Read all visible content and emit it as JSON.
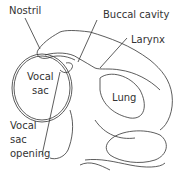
{
  "diagram": {
    "labels": {
      "nostril": "Nostril",
      "buccal_cavity": "Buccal cavity",
      "larynx": "Larynx",
      "vocal_sac_line1": "Vocal",
      "vocal_sac_line2": "sac",
      "lung": "Lung",
      "vocal_sac_opening_line1": "Vocal",
      "vocal_sac_opening_line2": "sac",
      "vocal_sac_opening_line3": "opening"
    },
    "colors": {
      "line": "#333333",
      "background": "#ffffff"
    }
  }
}
